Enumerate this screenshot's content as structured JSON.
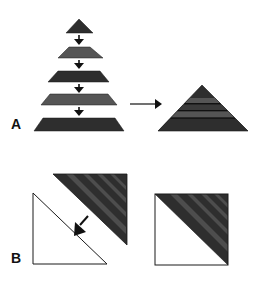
{
  "figure": {
    "colors": {
      "dark": "#2e2e2e",
      "medium": "#555555",
      "stripe_gray": "#4d4d4d",
      "outline": "#1a1a1a",
      "background": "#ffffff",
      "white_fill": "#ffffff"
    },
    "panels": [
      {
        "label": "A",
        "elements": [
          {
            "type": "triangle",
            "role": "top-slice",
            "fill": "dark"
          },
          {
            "type": "arrow",
            "direction": "down"
          },
          {
            "type": "trapezoid",
            "role": "slice-2",
            "fill": "medium"
          },
          {
            "type": "arrow",
            "direction": "down"
          },
          {
            "type": "trapezoid",
            "role": "slice-3",
            "fill": "dark"
          },
          {
            "type": "arrow",
            "direction": "down"
          },
          {
            "type": "trapezoid",
            "role": "slice-4",
            "fill": "medium"
          },
          {
            "type": "arrow",
            "direction": "down"
          },
          {
            "type": "trapezoid",
            "role": "slice-5",
            "fill": "dark"
          },
          {
            "type": "arrow",
            "direction": "right"
          },
          {
            "type": "triangle",
            "role": "assembled-striped-triangle",
            "bands": 5
          }
        ]
      },
      {
        "label": "B",
        "elements": [
          {
            "type": "triangle",
            "role": "white-right-triangle",
            "fill": "white"
          },
          {
            "type": "triangle",
            "role": "dark-striped-triangle",
            "fill": "dark"
          },
          {
            "type": "arrow",
            "direction": "down-left"
          },
          {
            "type": "square",
            "role": "assembled-square",
            "halves": [
              "white",
              "dark-striped"
            ]
          }
        ]
      }
    ]
  }
}
